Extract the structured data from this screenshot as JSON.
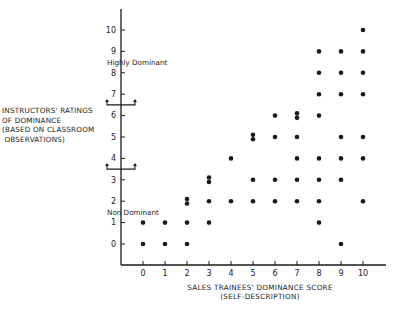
{
  "chart_data": {
    "type": "scatter",
    "title": "",
    "xlabel": "SALES TRAINEES' DOMINANCE SCORE",
    "xlabel_sub": "(SELF-DESCRIPTION)",
    "ylabel_lines": [
      "INSTRUCTORS' RATINGS",
      "OF DOMINANCE",
      "(BASED ON CLASSROOM",
      " OBSERVATIONS)"
    ],
    "x_ticks": [
      0,
      1,
      2,
      3,
      4,
      5,
      6,
      7,
      8,
      9,
      10
    ],
    "y_ticks": [
      0,
      1,
      2,
      3,
      4,
      5,
      6,
      7,
      8,
      9,
      10
    ],
    "xlim": [
      -1,
      11
    ],
    "ylim": [
      -1,
      11
    ],
    "grid": false,
    "legend": null,
    "annotations": [
      {
        "text": "Highly Dominant",
        "y": 8.5,
        "bracket_y": 6.5
      },
      {
        "text": "Non Dominant",
        "y": 1.5,
        "bracket_y": 3.5
      }
    ],
    "points": [
      {
        "x": 0,
        "y": 0
      },
      {
        "x": 0,
        "y": 1
      },
      {
        "x": 1,
        "y": 0
      },
      {
        "x": 1,
        "y": 1
      },
      {
        "x": 2,
        "y": 0
      },
      {
        "x": 2,
        "y": 1
      },
      {
        "x": 2,
        "y": 2
      },
      {
        "x": 2,
        "y": 2
      },
      {
        "x": 3,
        "y": 1
      },
      {
        "x": 3,
        "y": 2
      },
      {
        "x": 3,
        "y": 3
      },
      {
        "x": 3,
        "y": 3
      },
      {
        "x": 4,
        "y": 2
      },
      {
        "x": 4,
        "y": 4
      },
      {
        "x": 5,
        "y": 2
      },
      {
        "x": 5,
        "y": 3
      },
      {
        "x": 5,
        "y": 5
      },
      {
        "x": 5,
        "y": 5
      },
      {
        "x": 6,
        "y": 2
      },
      {
        "x": 6,
        "y": 3
      },
      {
        "x": 6,
        "y": 5
      },
      {
        "x": 6,
        "y": 6
      },
      {
        "x": 7,
        "y": 2
      },
      {
        "x": 7,
        "y": 3
      },
      {
        "x": 7,
        "y": 4
      },
      {
        "x": 7,
        "y": 5
      },
      {
        "x": 7,
        "y": 6
      },
      {
        "x": 7,
        "y": 6
      },
      {
        "x": 8,
        "y": 1
      },
      {
        "x": 8,
        "y": 2
      },
      {
        "x": 8,
        "y": 3
      },
      {
        "x": 8,
        "y": 4
      },
      {
        "x": 8,
        "y": 6
      },
      {
        "x": 8,
        "y": 7
      },
      {
        "x": 8,
        "y": 8
      },
      {
        "x": 8,
        "y": 9
      },
      {
        "x": 9,
        "y": 0
      },
      {
        "x": 9,
        "y": 3
      },
      {
        "x": 9,
        "y": 4
      },
      {
        "x": 9,
        "y": 5
      },
      {
        "x": 9,
        "y": 7
      },
      {
        "x": 9,
        "y": 8
      },
      {
        "x": 9,
        "y": 9
      },
      {
        "x": 10,
        "y": 2
      },
      {
        "x": 10,
        "y": 4
      },
      {
        "x": 10,
        "y": 5
      },
      {
        "x": 10,
        "y": 7
      },
      {
        "x": 10,
        "y": 8
      },
      {
        "x": 10,
        "y": 9
      },
      {
        "x": 10,
        "y": 10
      }
    ],
    "colors": {
      "ink": "#1a1a1a",
      "background": "#ffffff"
    }
  }
}
